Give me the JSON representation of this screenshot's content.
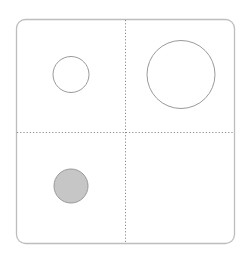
{
  "figure": {
    "panel_label": "(b)",
    "panel_label_visible_fragment": ")",
    "grid": {
      "rows": 2,
      "cols": 2,
      "divider_style": "dotted"
    },
    "colors": {
      "frame": "#bdbdbd",
      "divider": "#8a8a8a",
      "circle_stroke": "#9a9a9a",
      "filled_circle_fill": "#c6c6c6"
    },
    "cells": [
      {
        "position": "top-left",
        "shape": "circle",
        "size": "small",
        "filled": false
      },
      {
        "position": "top-right",
        "shape": "circle",
        "size": "large",
        "filled": false
      },
      {
        "position": "bottom-left",
        "shape": "circle",
        "size": "small",
        "filled": true
      },
      {
        "position": "bottom-right",
        "shape": "none"
      }
    ]
  }
}
